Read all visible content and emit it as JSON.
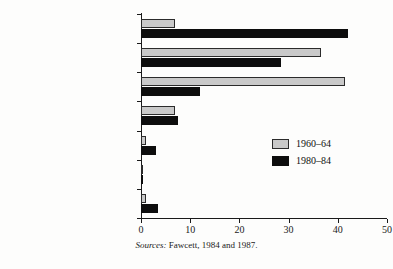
{
  "chart_data": {
    "type": "bar",
    "orientation": "horizontal",
    "title": "",
    "xlabel": "",
    "ylabel": "",
    "xlim": [
      0,
      50
    ],
    "xticks": [
      0,
      10,
      20,
      30,
      40,
      50
    ],
    "grid": false,
    "legend_position": "middle-right",
    "categories": [
      "Asia",
      "North/Central America",
      "Europe",
      "South America",
      "Africa",
      "Oceanic",
      "Other"
    ],
    "series": [
      {
        "name": "1960–64",
        "color": "#c9c9c9",
        "values": [
          7,
          36.5,
          41.5,
          7,
          1,
          0.5,
          1
        ]
      },
      {
        "name": "1980–84",
        "color": "#0d0d0d",
        "values": [
          42,
          28.5,
          12,
          7.5,
          3,
          0.5,
          3.5
        ]
      }
    ]
  },
  "legend": {
    "items": [
      {
        "label": "1960–64",
        "swatch": "old"
      },
      {
        "label": "1980–84",
        "swatch": "new"
      }
    ]
  },
  "axis": {
    "tick_labels": [
      "0",
      "10",
      "20",
      "30",
      "40",
      "50"
    ]
  },
  "caption": {
    "source_word": "Sources:",
    "source_text": "Fawcett, 1984 and 1987."
  }
}
